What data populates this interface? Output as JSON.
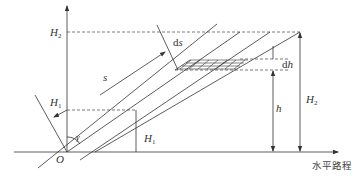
{
  "diagram": {
    "title": "",
    "labels": {
      "origin": "O",
      "H2_axis": "H",
      "H2_axis_sub": "2",
      "H2_right": "H",
      "H2_right_sub": "2",
      "H1_arrow": "H",
      "H1_arrow_sub": "1",
      "H1_vertical": "H",
      "H1_vertical_sub": "1",
      "s": "s",
      "ds_d": "d",
      "ds_s": "s",
      "dh_d": "d",
      "dh_h": "h",
      "h": "h",
      "gamma": "γ",
      "x_axis": "水平路程"
    },
    "colors": {
      "line": "#333333",
      "background": "#ffffff"
    }
  }
}
